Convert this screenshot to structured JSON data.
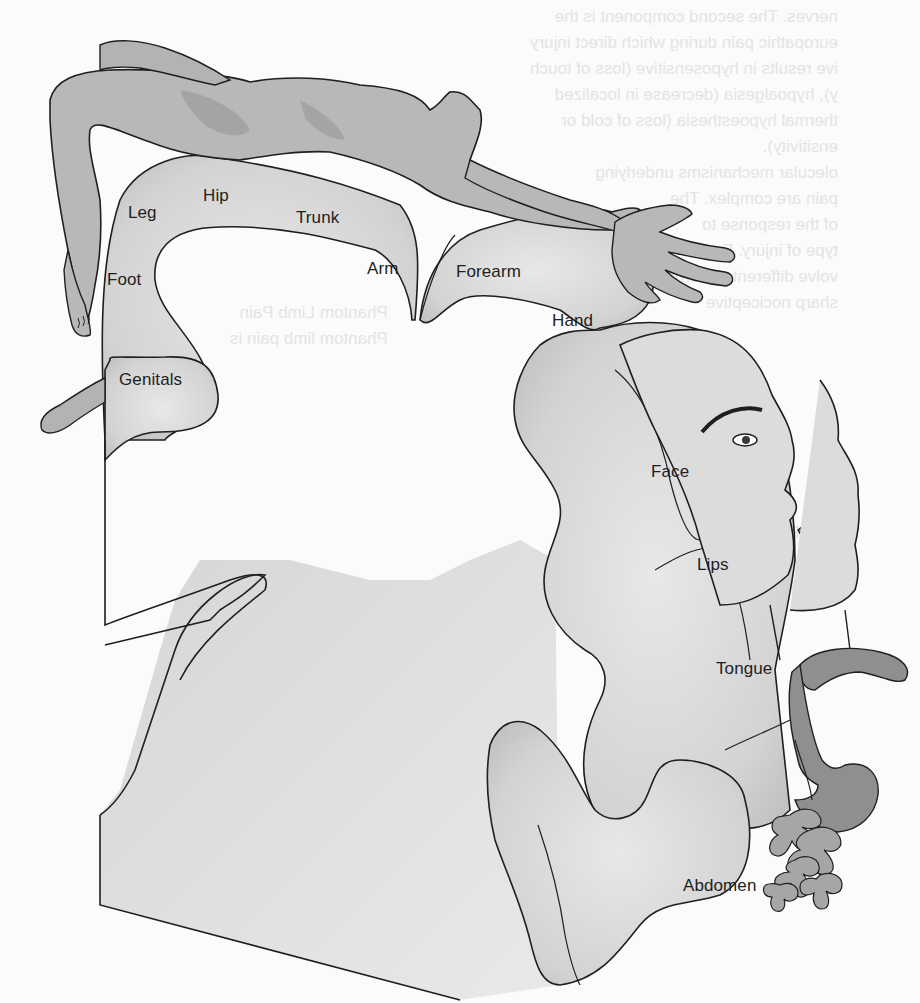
{
  "diagram": {
    "colors": {
      "background": "#fbfbfb",
      "cortex_fill": "#d9d9d9",
      "cortex_shadow": "#bdbdbd",
      "figure_fill": "#b8b8b8",
      "figure_shade": "#a2a2a2",
      "organ_fill": "#8f8f8f",
      "outline": "#1f1f1f",
      "label_text": "#1e1e1e"
    },
    "labels": [
      {
        "id": "leg",
        "text": "Leg"
      },
      {
        "id": "hip",
        "text": "Hip"
      },
      {
        "id": "trunk",
        "text": "Trunk"
      },
      {
        "id": "foot",
        "text": "Foot"
      },
      {
        "id": "arm",
        "text": "Arm"
      },
      {
        "id": "forearm",
        "text": "Forearm"
      },
      {
        "id": "hand",
        "text": "Hand"
      },
      {
        "id": "genitals",
        "text": "Genitals"
      },
      {
        "id": "face",
        "text": "Face"
      },
      {
        "id": "lips",
        "text": "Lips"
      },
      {
        "id": "tongue",
        "text": "Tongue"
      },
      {
        "id": "abdomen",
        "text": "Abdomen"
      }
    ]
  },
  "background_bleedthrough": {
    "lines": [
      "nerves. The second component is the",
      "europathic pain during which direct injury",
      "ive results in hyposensitive (loss of touch",
      "y), hypoalgesia (decrease in localized",
      "thermal hypoesthesia (loss of cold or",
      "ensitivity).",
      "olecular mechanisms underlying",
      "pain are complex. The",
      "of the response to",
      "type of injury. For",
      "volve different patterns",
      "sharp nociceptive",
      "ness",
      "nto",
      "Phantom Limb Pain",
      "Phantom limb pain is",
      "Pain Syndrome",
      "with complex regional pain syndrome",
      "ntensity and affect that",
      "Abdomen"
    ]
  }
}
